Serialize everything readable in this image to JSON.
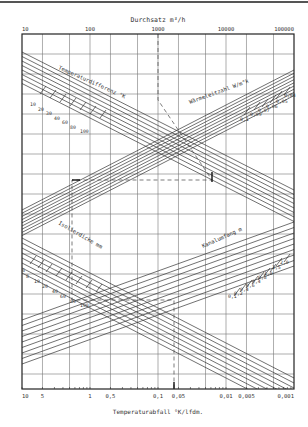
{
  "chart_data": {
    "type": "line",
    "title": "Durchsatz m³/h",
    "top_axis": {
      "label": "Durchsatz m³/h",
      "scale": "log",
      "ticks": [
        "10",
        "100",
        "1000",
        "10000",
        "100000"
      ],
      "range": [
        10,
        100000
      ]
    },
    "bottom_axis": {
      "label": "Temperaturabfall °K/lfdm.",
      "scale": "log-reversed",
      "ticks": [
        "10",
        "5",
        "1",
        "0,5",
        "0,1",
        "0,05",
        "0,01",
        "0,005",
        "0,001"
      ],
      "range": [
        10,
        0.001
      ]
    },
    "grid": true,
    "families": [
      {
        "name": "Temperaturdifferenz °K",
        "direction": "descending",
        "quadrant": "upper-left",
        "values": [
          "10",
          "20",
          "30",
          "40",
          "60",
          "80",
          "100"
        ]
      },
      {
        "name": "Wärmeleitzahl W/m°k",
        "direction": "ascending",
        "quadrant": "upper-right",
        "values": [
          "0,1",
          "0,09",
          "0,07",
          "0,06",
          "0,05",
          "0,04"
        ]
      },
      {
        "name": "Isolierdicke mm",
        "direction": "descending",
        "quadrant": "lower-left",
        "values": [
          "6",
          "8",
          "10",
          "20",
          "40",
          "60",
          "80",
          "100"
        ]
      },
      {
        "name": "Kanalumfang m",
        "direction": "ascending",
        "quadrant": "lower-right",
        "values": [
          "0,1",
          "0,2",
          "0,4",
          "0,6",
          "0,4",
          "0,8",
          "1,0",
          "1,5",
          "2,0"
        ]
      }
    ],
    "example_path": {
      "style": "dashed",
      "description": "Reading example: from Durchsatz ~1000 down, across horizontally, down to Temperaturabfall ~0,05"
    }
  },
  "labels": {
    "top_title": "Durchsatz  m³/h",
    "bottom_title": "Temperaturabfall  °K/lfdm.",
    "top_ticks": [
      "10",
      "100",
      "1000",
      "10000",
      "100000"
    ],
    "bottom_ticks": [
      "10",
      "5",
      "1",
      "0,5",
      "0,1",
      "0,05",
      "0,01",
      "0,005",
      "0,001"
    ],
    "temp_diff": "Temperaturdifferenz  °K",
    "temp_diff_values": [
      "10",
      "20",
      "30",
      "40",
      "60",
      "80",
      "100"
    ],
    "waerme": "Wärmeleitzahl  W/m°k",
    "waerme_values": [
      "0,1",
      "0,09",
      "0,07",
      "0,06",
      "0,05",
      "0,04"
    ],
    "iso": "Isolierdicke  mm",
    "iso_values": [
      "6",
      "8",
      "10",
      "20",
      "40",
      "60",
      "80",
      "100"
    ],
    "kanal": "Kanalumfang  m",
    "kanal_values": [
      "0,1",
      "0,2",
      "0,4",
      "0,6",
      "0,4",
      "0,8",
      "1,0",
      "1,5",
      "2,0"
    ]
  }
}
